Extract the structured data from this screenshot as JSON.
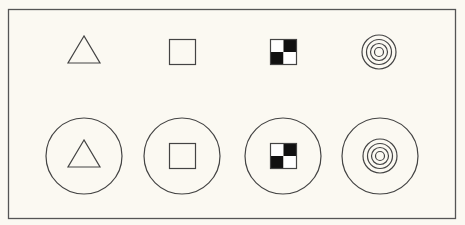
{
  "figure": {
    "background": "#fbf9f2",
    "stroke": "#444444",
    "fill_dark": "#111111",
    "frame": {
      "x": 8,
      "y": 9,
      "width": 447,
      "height": 209
    },
    "top_row": [
      {
        "shape": "triangle",
        "cx": 84,
        "cy": 50
      },
      {
        "shape": "square",
        "cx": 182,
        "cy": 52
      },
      {
        "shape": "checkerboard",
        "cx": 283,
        "cy": 52
      },
      {
        "shape": "concentric-circles",
        "cx": 379,
        "cy": 52
      }
    ],
    "bottom_row": [
      {
        "shape": "triangle-in-circle",
        "cx": 84,
        "cy": 156
      },
      {
        "shape": "square-in-circle",
        "cx": 182,
        "cy": 156
      },
      {
        "shape": "checkerboard-in-circle",
        "cx": 283,
        "cy": 156
      },
      {
        "shape": "concentric-circles-in-circle",
        "cx": 380,
        "cy": 156
      }
    ]
  }
}
